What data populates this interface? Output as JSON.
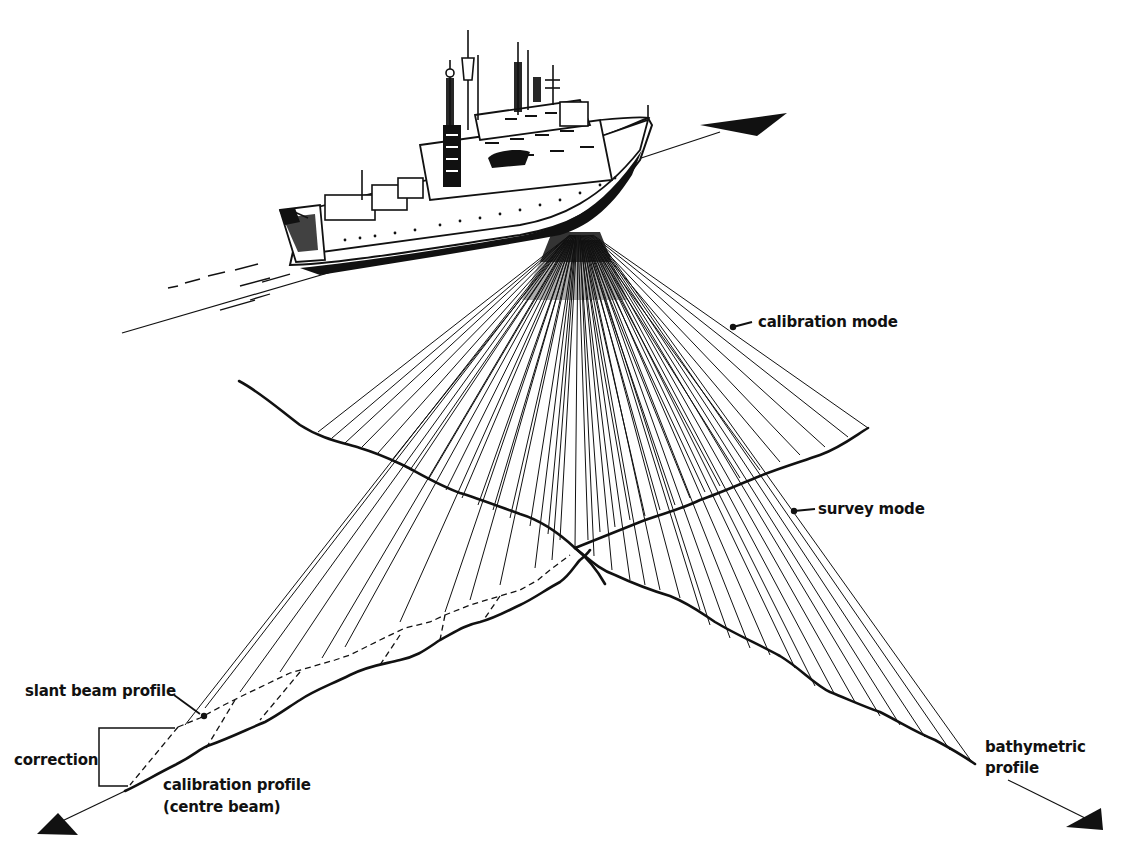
{
  "diagram": {
    "labels": {
      "calibration_mode": "calibration mode",
      "survey_mode": "survey mode",
      "slant_beam_profile": "slant beam profile",
      "correction": "correction",
      "calibration_profile_line1": "calibration profile",
      "calibration_profile_line2": "(centre beam)",
      "bathymetric_profile_line1": "bathymetric",
      "bathymetric_profile_line2": "profile"
    },
    "arrows": [
      {
        "name": "ship-heading-arrow",
        "direction": "up-right"
      },
      {
        "name": "calibration-track-arrow",
        "direction": "down-left"
      },
      {
        "name": "bathymetric-track-arrow",
        "direction": "down-right"
      }
    ],
    "colors": {
      "ink": "#111111",
      "paper": "#ffffff"
    }
  }
}
